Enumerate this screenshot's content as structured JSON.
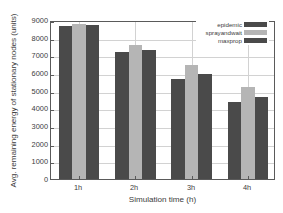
{
  "chart_data": {
    "type": "bar",
    "title": "",
    "subtitle": "",
    "xlabel": "Simulation time (h)",
    "ylabel": "Avg. remaining energy of stationary nodes (units)",
    "categories": [
      "1h",
      "2h",
      "3h",
      "4h"
    ],
    "series": [
      {
        "name": "epidemic",
        "values": [
          8650,
          7200,
          5680,
          4380
        ],
        "color": "#4a4a4a"
      },
      {
        "name": "sprayandwait",
        "values": [
          8800,
          7600,
          6430,
          5230
        ],
        "color": "#b5b5b5"
      },
      {
        "name": "maxprop",
        "values": [
          8700,
          7320,
          5950,
          4620
        ],
        "color": "#4a4a4a"
      }
    ],
    "ylim": [
      0,
      9000
    ],
    "yticks": [
      0,
      1000,
      2000,
      3000,
      4000,
      5000,
      6000,
      7000,
      8000,
      9000
    ],
    "ytick_labels": [
      "0",
      "1000",
      "2000",
      "3000",
      "4000",
      "5000",
      "6000",
      "7000",
      "8000",
      "9000"
    ],
    "grid": true,
    "legend_position": "top-right",
    "legend_entries": [
      "epidemic",
      "sprayandwait",
      "maxprop"
    ]
  },
  "colors": {
    "series_dark": "#4a4a4a",
    "series_light": "#b5b5b5",
    "grid": "#d2d2d2",
    "axis": "#5a5a5a",
    "text": "#3c3c3c",
    "background": "#ffffff"
  }
}
